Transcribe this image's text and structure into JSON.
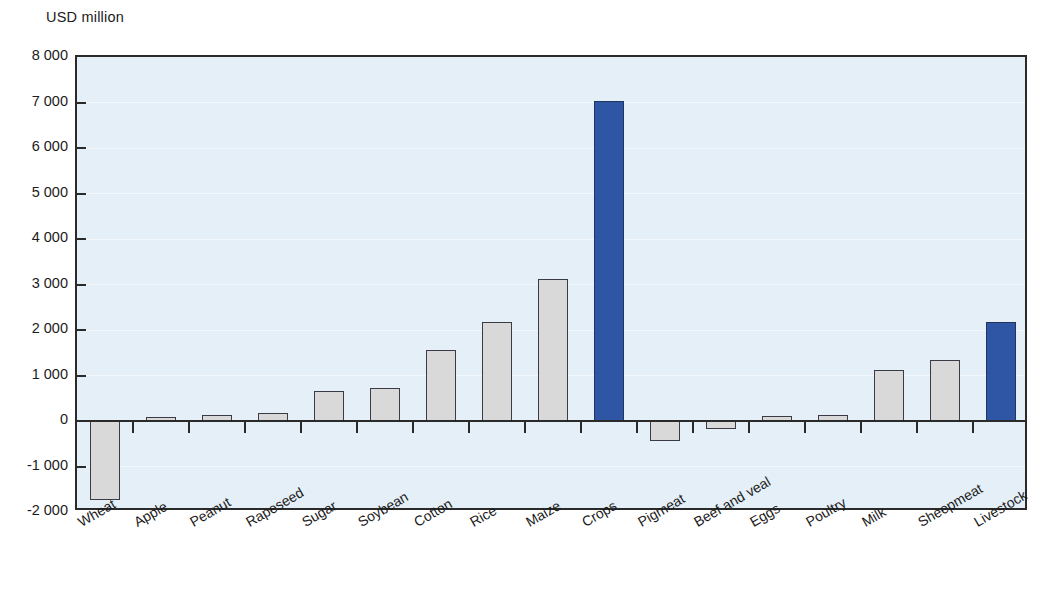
{
  "chart_data": {
    "type": "bar",
    "title": "",
    "subtitle": "",
    "unit_label": "USD million",
    "xlabel": "",
    "ylabel": "USD million",
    "ylim": [
      -2000,
      8000
    ],
    "grid": true,
    "legend": "none",
    "y_ticks": [
      {
        "value": 8000,
        "label": "8 000"
      },
      {
        "value": 7000,
        "label": "7 000"
      },
      {
        "value": 6000,
        "label": "6 000"
      },
      {
        "value": 5000,
        "label": "5 000"
      },
      {
        "value": 4000,
        "label": "4 000"
      },
      {
        "value": 3000,
        "label": "3 000"
      },
      {
        "value": 2000,
        "label": "2 000"
      },
      {
        "value": 1000,
        "label": "1 000"
      },
      {
        "value": 0,
        "label": "0"
      },
      {
        "value": -1000,
        "label": "-1 000"
      },
      {
        "value": -2000,
        "label": "-2 000"
      }
    ],
    "categories": [
      "Wheat",
      "Apple",
      "Peanut",
      "Rapeseed",
      "Sugar",
      "Soybean",
      "Cotton",
      "Rice",
      "Maize",
      "Crops",
      "Pigmeat",
      "Beef and veal",
      "Eggs",
      "Poultry",
      "Milk",
      "Sheepmeat",
      "Livestock"
    ],
    "values": [
      -1730,
      90,
      140,
      170,
      660,
      730,
      1570,
      2180,
      3120,
      7040,
      -440,
      -180,
      100,
      130,
      1120,
      1340,
      2170
    ],
    "highlight_categories": [
      "Crops",
      "Livestock"
    ],
    "colors": {
      "bar_default": "#d9d9d9",
      "bar_highlight": "#2f56a5",
      "bar_border": "#3b3b45",
      "plot_background": "#e4eff7",
      "axis": "#2a2a2a",
      "gridline": "#f2f8fc",
      "text": "#1b1b1b"
    }
  }
}
